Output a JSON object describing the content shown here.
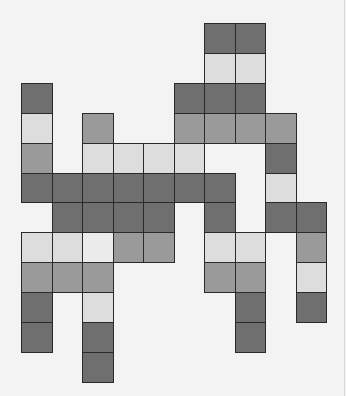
{
  "grid": {
    "origin_x": 21,
    "origin_y": 23,
    "cell_w": 30.5,
    "cell_h": 29.9,
    "columns": 10,
    "rows": 12
  },
  "palette": {
    "dark": "#6f6f6f",
    "mid": "#9a9a9a",
    "light": "#dddddd",
    "vlight": "#ececec",
    "background": "#f3f3f3",
    "border": "#2a2a2a"
  },
  "cells": [
    {
      "r": 0,
      "c": 6,
      "shade": "dark"
    },
    {
      "r": 0,
      "c": 7,
      "shade": "dark"
    },
    {
      "r": 1,
      "c": 6,
      "shade": "light"
    },
    {
      "r": 1,
      "c": 7,
      "shade": "light"
    },
    {
      "r": 2,
      "c": 0,
      "shade": "dark"
    },
    {
      "r": 2,
      "c": 5,
      "shade": "dark"
    },
    {
      "r": 2,
      "c": 6,
      "shade": "dark"
    },
    {
      "r": 2,
      "c": 7,
      "shade": "dark"
    },
    {
      "r": 3,
      "c": 0,
      "shade": "light"
    },
    {
      "r": 3,
      "c": 2,
      "shade": "mid"
    },
    {
      "r": 3,
      "c": 5,
      "shade": "mid"
    },
    {
      "r": 3,
      "c": 6,
      "shade": "mid"
    },
    {
      "r": 3,
      "c": 7,
      "shade": "mid"
    },
    {
      "r": 3,
      "c": 8,
      "shade": "mid"
    },
    {
      "r": 4,
      "c": 0,
      "shade": "mid"
    },
    {
      "r": 4,
      "c": 2,
      "shade": "light"
    },
    {
      "r": 4,
      "c": 3,
      "shade": "light"
    },
    {
      "r": 4,
      "c": 4,
      "shade": "light"
    },
    {
      "r": 4,
      "c": 5,
      "shade": "light"
    },
    {
      "r": 4,
      "c": 8,
      "shade": "dark"
    },
    {
      "r": 5,
      "c": 0,
      "shade": "dark"
    },
    {
      "r": 5,
      "c": 1,
      "shade": "dark"
    },
    {
      "r": 5,
      "c": 2,
      "shade": "dark"
    },
    {
      "r": 5,
      "c": 3,
      "shade": "dark"
    },
    {
      "r": 5,
      "c": 4,
      "shade": "dark"
    },
    {
      "r": 5,
      "c": 5,
      "shade": "dark"
    },
    {
      "r": 5,
      "c": 6,
      "shade": "dark"
    },
    {
      "r": 5,
      "c": 8,
      "shade": "light"
    },
    {
      "r": 6,
      "c": 1,
      "shade": "dark"
    },
    {
      "r": 6,
      "c": 2,
      "shade": "dark"
    },
    {
      "r": 6,
      "c": 3,
      "shade": "dark"
    },
    {
      "r": 6,
      "c": 4,
      "shade": "dark"
    },
    {
      "r": 6,
      "c": 6,
      "shade": "dark"
    },
    {
      "r": 6,
      "c": 8,
      "shade": "dark"
    },
    {
      "r": 6,
      "c": 9,
      "shade": "dark"
    },
    {
      "r": 7,
      "c": 0,
      "shade": "light"
    },
    {
      "r": 7,
      "c": 1,
      "shade": "light"
    },
    {
      "r": 7,
      "c": 2,
      "shade": "vlight"
    },
    {
      "r": 7,
      "c": 3,
      "shade": "mid"
    },
    {
      "r": 7,
      "c": 4,
      "shade": "mid"
    },
    {
      "r": 7,
      "c": 6,
      "shade": "light"
    },
    {
      "r": 7,
      "c": 7,
      "shade": "light"
    },
    {
      "r": 7,
      "c": 9,
      "shade": "mid"
    },
    {
      "r": 8,
      "c": 0,
      "shade": "mid"
    },
    {
      "r": 8,
      "c": 1,
      "shade": "mid"
    },
    {
      "r": 8,
      "c": 2,
      "shade": "mid"
    },
    {
      "r": 8,
      "c": 6,
      "shade": "mid"
    },
    {
      "r": 8,
      "c": 7,
      "shade": "mid"
    },
    {
      "r": 8,
      "c": 9,
      "shade": "light"
    },
    {
      "r": 9,
      "c": 0,
      "shade": "dark"
    },
    {
      "r": 9,
      "c": 2,
      "shade": "light"
    },
    {
      "r": 9,
      "c": 7,
      "shade": "dark"
    },
    {
      "r": 9,
      "c": 9,
      "shade": "dark"
    },
    {
      "r": 10,
      "c": 0,
      "shade": "dark"
    },
    {
      "r": 10,
      "c": 2,
      "shade": "dark"
    },
    {
      "r": 10,
      "c": 7,
      "shade": "dark"
    },
    {
      "r": 11,
      "c": 2,
      "shade": "dark"
    }
  ]
}
